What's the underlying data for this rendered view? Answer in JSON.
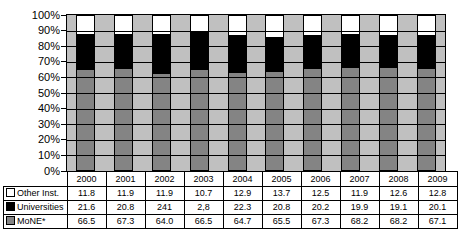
{
  "colors": {
    "plot_bg": "#c0c0c0",
    "gridline": "#000000",
    "bar_border": "#000000",
    "table_bg": "#ffffff",
    "series_other": "#ffffff",
    "series_universities": "#000000",
    "series_mone": "#848484"
  },
  "chart_data": {
    "type": "bar",
    "stacked": true,
    "percent": true,
    "title": "",
    "xlabel": "",
    "ylabel": "",
    "grid": true,
    "legend_position": "table-left",
    "categories": [
      "2000",
      "2001",
      "2002",
      "2003",
      "2004",
      "2005",
      "2006",
      "2007",
      "2008",
      "2009"
    ],
    "series": [
      {
        "name": "Other Inst.",
        "color": "#ffffff",
        "values": [
          11.8,
          11.9,
          11.9,
          10.7,
          12.9,
          13.7,
          12.5,
          11.9,
          12.6,
          12.8
        ],
        "display": [
          "11.8",
          "11.9",
          "11.9",
          "10.7",
          "12.9",
          "13.7",
          "12.5",
          "11.9",
          "12.6",
          "12.8"
        ]
      },
      {
        "name": "Universities",
        "color": "#000000",
        "values": [
          21.6,
          20.8,
          24.1,
          22.8,
          22.3,
          20.8,
          20.2,
          19.9,
          19.1,
          20.1
        ],
        "display": [
          "21.6",
          "20.8",
          "241",
          "2,8",
          "22.3",
          "20.8",
          "20.2",
          "19.9",
          "19.1",
          "20.1"
        ]
      },
      {
        "name": "MoNE*",
        "color": "#848484",
        "values": [
          66.5,
          67.3,
          64.0,
          66.5,
          64.7,
          65.5,
          67.3,
          68.2,
          68.2,
          67.1
        ],
        "display": [
          "66.5",
          "67.3",
          "64.0",
          "66.5",
          "64.7",
          "65.5",
          "67.3",
          "68.2",
          "68.2",
          "67.1"
        ]
      }
    ],
    "y_axis": {
      "min": 0,
      "max": 100,
      "step": 10,
      "ticks": [
        "100%",
        "90%",
        "80%",
        "70%",
        "60%",
        "50%",
        "40%",
        "30%",
        "20%",
        "10%",
        "0%"
      ]
    }
  }
}
